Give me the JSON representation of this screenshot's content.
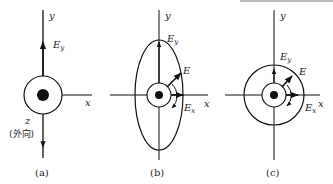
{
  "figure": {
    "panels": [
      {
        "caption": "(a)",
        "axis_y": "y",
        "axis_x": "x",
        "axis_z": "z",
        "z_note": "(外向)",
        "field_label": "E",
        "field_sub": "y"
      },
      {
        "caption": "(b)",
        "axis_y": "y",
        "axis_x": "x",
        "ey_label": "E",
        "ey_sub": "y",
        "e_label": "E",
        "ex_label": "E",
        "ex_sub": "x",
        "shape": "ellipse"
      },
      {
        "caption": "(c)",
        "axis_y": "y",
        "axis_x": "x",
        "ey_label": "E",
        "ey_sub": "y",
        "e_label": "E",
        "ex_label": "E",
        "ex_sub": "x",
        "shape": "circle"
      }
    ]
  }
}
